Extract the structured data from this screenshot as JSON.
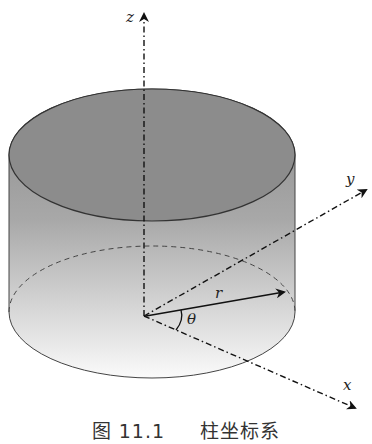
{
  "diagram": {
    "axes": {
      "z": "z",
      "y": "y",
      "x": "x"
    },
    "radius_label": "r",
    "angle_label": "θ"
  },
  "caption": {
    "number": "图 11.1",
    "text": "柱坐标系"
  }
}
